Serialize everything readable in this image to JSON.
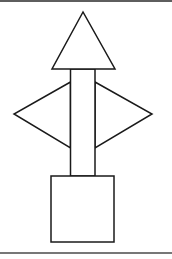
{
  "diagram": {
    "colors": {
      "stroke": "#1a1a1a",
      "fill": "#ffffff",
      "top_rule": "#5e5e5e",
      "bottom_rule": "#777777"
    },
    "shapes": {
      "top_triangle": {
        "points": "83,12 52,69 115,69"
      },
      "shaft": {
        "x": 70.5,
        "y": 69,
        "width": 24.5,
        "height": 107
      },
      "left_triangle": {
        "points": "70.5,82 14,114 70.5,148"
      },
      "right_triangle": {
        "points": "95,82 152,114 95,148"
      },
      "base_square": {
        "x": 51,
        "y": 176,
        "width": 63,
        "height": 66
      }
    }
  }
}
